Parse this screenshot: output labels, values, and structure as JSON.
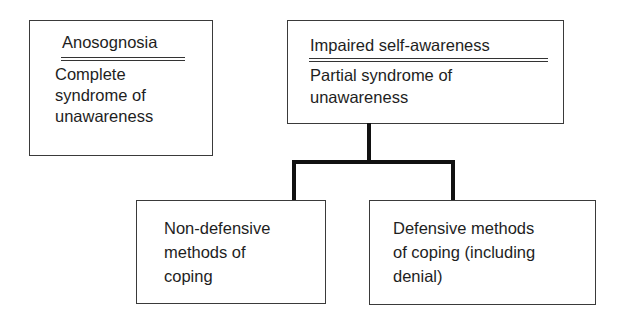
{
  "boxes": {
    "anosognosia": {
      "title": "Anosognosia",
      "lines": [
        "Complete",
        "syndrome of",
        "unawareness"
      ]
    },
    "impaired": {
      "title": "Impaired self-awareness",
      "lines": [
        "Partial syndrome of",
        "unawareness"
      ]
    },
    "non_defensive": {
      "lines": [
        "Non-defensive",
        "methods of",
        "coping"
      ]
    },
    "defensive": {
      "lines": [
        "Defensive methods",
        "of coping (including",
        "denial)"
      ]
    }
  },
  "colors": {
    "line": "#111111",
    "border": "#3a3a3a",
    "text": "#1e1e1e"
  }
}
